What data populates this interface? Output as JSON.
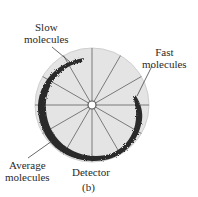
{
  "figure": {
    "caption": "(b)",
    "disc": {
      "cx": 92,
      "cy": 105,
      "r": 57,
      "fill": "#e4e4e4",
      "spoke_color": "#7a7a7a",
      "spokes": 12
    },
    "deposit_color": "#2b2b2b",
    "labels": {
      "slow": [
        "Slow",
        "molecules"
      ],
      "fast": [
        "Fast",
        "molecules"
      ],
      "average": [
        "Average",
        "molecules"
      ],
      "detector": "Detector"
    }
  }
}
